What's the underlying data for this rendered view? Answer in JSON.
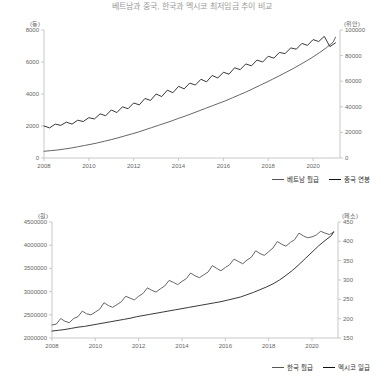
{
  "header": {
    "title": "베트남과 중국, 한국과 멕시코 최저임금 추이 비교"
  },
  "chart_data": [
    {
      "type": "line",
      "title": "",
      "xlabel": "",
      "ylabel_left": "(동)",
      "ylabel_right": "(위안)",
      "x": [
        2008,
        2010,
        2012,
        2014,
        2016,
        2018,
        2020
      ],
      "xlim": [
        2008,
        2021.2
      ],
      "ylim_left": [
        0,
        8000
      ],
      "ylim_right": [
        0,
        100000
      ],
      "yticks_left": [
        0,
        2000,
        4000,
        6000,
        8000
      ],
      "yticks_right": [
        0,
        20000,
        40000,
        60000,
        80000,
        100000
      ],
      "grid": false,
      "legend_position": "bottom-right",
      "series": [
        {
          "name": "베트남 월급",
          "axis": "left",
          "color": "#555555",
          "x": [
            2008.0,
            2008.3,
            2008.6,
            2008.9,
            2009.2,
            2009.5,
            2009.8,
            2010.1,
            2010.4,
            2010.7,
            2011.0,
            2011.3,
            2011.6,
            2011.9,
            2012.2,
            2012.5,
            2012.8,
            2013.1,
            2013.4,
            2013.7,
            2014.0,
            2014.3,
            2014.6,
            2014.9,
            2015.2,
            2015.5,
            2015.8,
            2016.1,
            2016.4,
            2016.7,
            2017.0,
            2017.3,
            2017.6,
            2017.9,
            2018.2,
            2018.5,
            2018.8,
            2019.1,
            2019.4,
            2019.7,
            2020.0,
            2020.3,
            2020.6,
            2020.9,
            2021.0
          ],
          "values": [
            420,
            460,
            500,
            560,
            620,
            700,
            780,
            860,
            950,
            1050,
            1150,
            1260,
            1380,
            1500,
            1620,
            1760,
            1900,
            2040,
            2180,
            2320,
            2480,
            2620,
            2780,
            2940,
            3100,
            3260,
            3420,
            3580,
            3760,
            3940,
            4120,
            4320,
            4520,
            4720,
            4930,
            5140,
            5360,
            5580,
            5820,
            6060,
            6320,
            6600,
            6900,
            7250,
            7550
          ]
        },
        {
          "name": "중국 연봉",
          "axis": "right",
          "color": "#222222",
          "x": [
            2008.0,
            2008.25,
            2008.5,
            2008.75,
            2009.0,
            2009.25,
            2009.5,
            2009.75,
            2010.0,
            2010.25,
            2010.5,
            2010.75,
            2011.0,
            2011.25,
            2011.5,
            2011.75,
            2012.0,
            2012.25,
            2012.5,
            2012.75,
            2013.0,
            2013.25,
            2013.5,
            2013.75,
            2014.0,
            2014.25,
            2014.5,
            2014.75,
            2015.0,
            2015.25,
            2015.5,
            2015.75,
            2016.0,
            2016.25,
            2016.5,
            2016.75,
            2017.0,
            2017.25,
            2017.5,
            2017.75,
            2018.0,
            2018.25,
            2018.5,
            2018.75,
            2019.0,
            2019.25,
            2019.5,
            2019.75,
            2020.0,
            2020.25,
            2020.5,
            2020.75,
            2021.0
          ],
          "values": [
            25000,
            23500,
            26500,
            25500,
            28000,
            26500,
            29500,
            28500,
            31500,
            30500,
            34500,
            33000,
            37500,
            35500,
            40000,
            38500,
            43000,
            41500,
            46500,
            45000,
            50000,
            48000,
            53000,
            51000,
            56000,
            54000,
            58500,
            57000,
            61500,
            59500,
            64500,
            62500,
            67000,
            65500,
            70500,
            69000,
            73500,
            72000,
            76500,
            75000,
            79500,
            78000,
            82500,
            81500,
            86000,
            85000,
            89500,
            88000,
            92500,
            91000,
            95000,
            87000,
            90000
          ]
        }
      ]
    },
    {
      "type": "line",
      "title": "",
      "xlabel": "",
      "ylabel_left": "(원)",
      "ylabel_right": "(페소)",
      "x": [
        2008,
        2010,
        2012,
        2014,
        2016,
        2018,
        2020
      ],
      "xlim": [
        2008,
        2021.2
      ],
      "ylim_left": [
        2000000,
        4500000
      ],
      "ylim_right": [
        150,
        450
      ],
      "yticks_left": [
        2000000,
        2500000,
        3000000,
        3500000,
        4000000,
        4500000
      ],
      "yticks_right": [
        150,
        200,
        250,
        300,
        350,
        400,
        450
      ],
      "grid": false,
      "legend_position": "bottom-right",
      "series": [
        {
          "name": "한국 월급",
          "axis": "left",
          "color": "#555555",
          "x": [
            2008.0,
            2008.2,
            2008.4,
            2008.6,
            2008.8,
            2009.0,
            2009.2,
            2009.4,
            2009.6,
            2009.8,
            2010.0,
            2010.2,
            2010.4,
            2010.6,
            2010.8,
            2011.0,
            2011.2,
            2011.4,
            2011.6,
            2011.8,
            2012.0,
            2012.2,
            2012.4,
            2012.6,
            2012.8,
            2013.0,
            2013.2,
            2013.4,
            2013.6,
            2013.8,
            2014.0,
            2014.2,
            2014.4,
            2014.6,
            2014.8,
            2015.0,
            2015.2,
            2015.4,
            2015.6,
            2015.8,
            2016.0,
            2016.2,
            2016.4,
            2016.6,
            2016.8,
            2017.0,
            2017.2,
            2017.4,
            2017.6,
            2017.8,
            2018.0,
            2018.2,
            2018.4,
            2018.6,
            2018.8,
            2019.0,
            2019.2,
            2019.4,
            2019.6,
            2019.8,
            2020.0,
            2020.2,
            2020.4,
            2020.6,
            2020.8,
            2021.0
          ],
          "values": [
            2280000,
            2300000,
            2420000,
            2360000,
            2330000,
            2420000,
            2460000,
            2580000,
            2520000,
            2500000,
            2560000,
            2620000,
            2760000,
            2700000,
            2660000,
            2720000,
            2780000,
            2900000,
            2860000,
            2820000,
            2900000,
            2960000,
            3080000,
            3030000,
            2990000,
            3060000,
            3120000,
            3240000,
            3200000,
            3150000,
            3220000,
            3280000,
            3400000,
            3340000,
            3300000,
            3360000,
            3420000,
            3560000,
            3500000,
            3450000,
            3520000,
            3580000,
            3700000,
            3650000,
            3600000,
            3680000,
            3740000,
            3880000,
            3820000,
            3780000,
            3860000,
            3940000,
            4080000,
            4020000,
            3980000,
            4060000,
            4120000,
            4260000,
            4200000,
            4160000,
            4180000,
            4220000,
            4300000,
            4260000,
            4230000,
            4280000
          ]
        },
        {
          "name": "멕시코 일급",
          "axis": "right",
          "color": "#222222",
          "x": [
            2008.0,
            2008.3,
            2008.6,
            2008.9,
            2009.2,
            2009.5,
            2009.8,
            2010.1,
            2010.4,
            2010.7,
            2011.0,
            2011.3,
            2011.6,
            2011.9,
            2012.2,
            2012.5,
            2012.8,
            2013.1,
            2013.4,
            2013.7,
            2014.0,
            2014.3,
            2014.6,
            2014.9,
            2015.2,
            2015.5,
            2015.8,
            2016.1,
            2016.4,
            2016.7,
            2017.0,
            2017.3,
            2017.6,
            2017.9,
            2018.2,
            2018.5,
            2018.8,
            2019.1,
            2019.4,
            2019.7,
            2020.0,
            2020.3,
            2020.6,
            2020.9,
            2021.0
          ],
          "values": [
            168,
            170,
            172,
            175,
            178,
            180,
            183,
            186,
            189,
            192,
            195,
            198,
            201,
            205,
            208,
            211,
            214,
            217,
            220,
            223,
            226,
            229,
            232,
            235,
            238,
            241,
            244,
            248,
            252,
            256,
            262,
            268,
            275,
            282,
            290,
            300,
            312,
            325,
            340,
            356,
            372,
            388,
            402,
            415,
            425
          ]
        }
      ]
    }
  ],
  "legends": {
    "top": [
      {
        "label": "베트남 월급"
      },
      {
        "label": "중국 연봉"
      }
    ],
    "bottom": [
      {
        "label": "한국 월급"
      },
      {
        "label": "멕시코 일급"
      }
    ]
  }
}
